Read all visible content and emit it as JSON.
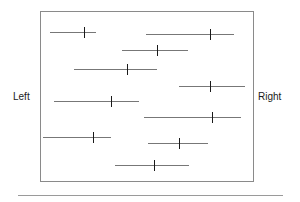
{
  "figure": {
    "name": "forest-plot",
    "axis_labels": {
      "left": "Left",
      "right": "Right"
    },
    "box": {
      "x": 40,
      "y": 11,
      "width": 214,
      "height": 171,
      "border_color": "#8a8a8a"
    },
    "footer_rule": {
      "x": 18,
      "y": 195,
      "width": 265,
      "color": "#9a9a9a"
    },
    "line_color": "#777777",
    "tick_color": "#1a1a1a"
  },
  "chart_data": {
    "type": "scatter",
    "title": "",
    "subtitle": "",
    "xlabel": "",
    "ylabel": "",
    "xlim": [
      0,
      214
    ],
    "ylim": [
      0,
      171
    ],
    "grid": false,
    "legend": "none",
    "annotations": [
      "Left",
      "Right"
    ],
    "series": [
      {
        "name": "confidence-intervals",
        "points": [
          {
            "index": 1,
            "y": 20,
            "low": 9,
            "estimate": 43,
            "high": 55
          },
          {
            "index": 2,
            "y": 22,
            "low": 105,
            "estimate": 169,
            "high": 193
          },
          {
            "index": 3,
            "y": 38,
            "low": 81,
            "estimate": 116,
            "high": 147
          },
          {
            "index": 4,
            "y": 57,
            "low": 33,
            "estimate": 86,
            "high": 116
          },
          {
            "index": 5,
            "y": 74,
            "low": 138,
            "estimate": 169,
            "high": 204
          },
          {
            "index": 6,
            "y": 89,
            "low": 13,
            "estimate": 70,
            "high": 98
          },
          {
            "index": 7,
            "y": 105,
            "low": 103,
            "estimate": 171,
            "high": 200
          },
          {
            "index": 8,
            "y": 125,
            "low": 2,
            "estimate": 52,
            "high": 70
          },
          {
            "index": 9,
            "y": 131,
            "low": 107,
            "estimate": 138,
            "high": 167
          },
          {
            "index": 10,
            "y": 153,
            "low": 74,
            "estimate": 113,
            "high": 148
          }
        ]
      }
    ]
  }
}
